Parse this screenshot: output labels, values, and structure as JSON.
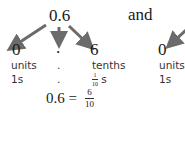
{
  "diagram": {
    "top_number": "0.6",
    "connector_word": "and",
    "left_group": {
      "digits": [
        {
          "digit": "0",
          "place_label": "units",
          "place_value": "1s"
        },
        {
          "digit": ".",
          "place_label": ".",
          "place_value": "."
        },
        {
          "digit": "6",
          "place_label": "tenths",
          "place_value_num": "1",
          "place_value_den": "10",
          "place_value_suffix": "s"
        }
      ]
    },
    "right_group": {
      "digit": "0",
      "place_label": "units",
      "place_value": "1s"
    },
    "equation": {
      "lhs": "0.6 =",
      "numerator": "6",
      "denominator": "10"
    },
    "arrow_color": "#6b6b6b"
  }
}
